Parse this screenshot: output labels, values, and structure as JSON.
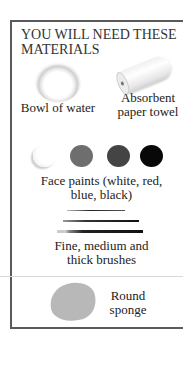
{
  "title": "YOU WILL NEED THESE MATERIALS",
  "title_lines": [
    "YOU WILL NEED THESE",
    "MATERIALS"
  ],
  "materials": [
    {
      "icon": "bowl-of-water-icon",
      "label": "Bowl of water"
    },
    {
      "icon": "paper-towel-icon",
      "label_lines": [
        "Absorbent",
        "paper towel"
      ]
    },
    {
      "icon": "face-paints-icon",
      "label_lines": [
        "Face paints (white, red,",
        "blue, black)"
      ],
      "colors": [
        {
          "name": "white",
          "hex": "#f4f4f4"
        },
        {
          "name": "red",
          "hex": "#6e6e6e"
        },
        {
          "name": "blue",
          "hex": "#444444"
        },
        {
          "name": "black",
          "hex": "#080808"
        }
      ]
    },
    {
      "icon": "brushes-icon",
      "label_lines": [
        "Fine, medium and",
        "thick brushes"
      ]
    },
    {
      "icon": "sponge-icon",
      "label_lines": [
        "Round",
        "sponge"
      ]
    }
  ],
  "colors": {
    "border": "#5a5a5a",
    "divider": "#d8d8d8",
    "text": "#222222"
  }
}
